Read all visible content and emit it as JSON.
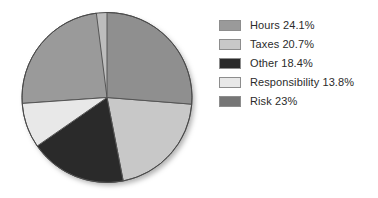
{
  "chart_data": {
    "type": "pie",
    "title": "",
    "categories": [
      "Hours",
      "Taxes",
      "Other",
      "Responsibility",
      "Risk"
    ],
    "values": [
      24.1,
      20.7,
      18.4,
      13.8,
      23.0
    ],
    "value_unit": "%",
    "legend_position": "right",
    "grid": false,
    "start_angle_deg": 0,
    "direction": "clockwise",
    "slices": [
      {
        "label": "Hours",
        "value": 24.1,
        "display": "Hours 24.1%",
        "color": "#9a9a9a",
        "start_deg": 266.0,
        "end_deg": 352.8
      },
      {
        "label": "Taxes",
        "value": 20.7,
        "display": "Taxes 20.7%",
        "color": "#c8c8c8",
        "start_deg": 94.5,
        "end_deg": 169.0
      },
      {
        "label": "Other",
        "value": 18.4,
        "display": "Other 18.4%",
        "color": "#2a2a2a",
        "start_deg": 169.0,
        "end_deg": 235.2
      },
      {
        "label": "Responsibility",
        "value": 13.8,
        "display": "Responsibility 13.8%",
        "color": "#e8e8e8",
        "start_deg": 235.2,
        "end_deg": 266.0
      },
      {
        "label": "Risk",
        "value": 23.0,
        "display": "Risk 23%",
        "color": "#8f8f8f",
        "start_deg": 0.0,
        "end_deg": 94.5
      }
    ]
  },
  "legend": {
    "items": [
      {
        "label": "Hours 24.1%",
        "color": "#9a9a9a"
      },
      {
        "label": "Taxes 20.7%",
        "color": "#c8c8c8"
      },
      {
        "label": "Other 18.4%",
        "color": "#2a2a2a"
      },
      {
        "label": "Responsibility 13.8%",
        "color": "#e8e8e8"
      },
      {
        "label": "Risk 23%",
        "color": "#767676"
      }
    ]
  },
  "style": {
    "background": "#ffffff",
    "slice_outline": "#555555",
    "text_color": "#2b2b2b"
  }
}
